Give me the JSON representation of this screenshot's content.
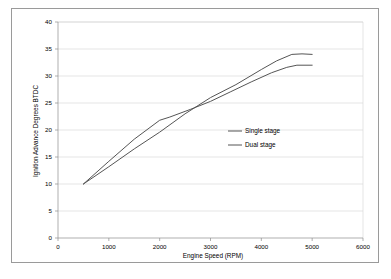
{
  "chart_data": {
    "type": "line",
    "title": "",
    "xlabel": "Engine Speed (RPM)",
    "ylabel": "Ignition Advance Degrees BTDC",
    "xlim": [
      0,
      6000
    ],
    "ylim": [
      0,
      40
    ],
    "xticks": [
      "0",
      "1000",
      "2000",
      "3000",
      "4000",
      "5000",
      "6000"
    ],
    "yticks": [
      "0",
      "5",
      "10",
      "15",
      "20",
      "25",
      "30",
      "35",
      "40"
    ],
    "grid": "horizontal",
    "legend_position": "center-right-inside",
    "series": [
      {
        "name": "Single stage",
        "color": "#555555",
        "x": [
          500,
          1000,
          1500,
          2000,
          2200,
          2600,
          3000,
          3400,
          3800,
          4200,
          4500,
          4700,
          5000
        ],
        "values": [
          10,
          14.2,
          18.3,
          21.8,
          22.4,
          23.8,
          25.3,
          27.1,
          28.9,
          30.6,
          31.6,
          32.0,
          32.0
        ]
      },
      {
        "name": "Dual stage",
        "color": "#555555",
        "x": [
          500,
          1000,
          1500,
          2000,
          2500,
          3000,
          3500,
          4000,
          4300,
          4600,
          4800,
          5000
        ],
        "values": [
          10,
          13.2,
          16.5,
          19.6,
          23.0,
          26.0,
          28.4,
          31.2,
          32.8,
          34.0,
          34.1,
          34.0
        ]
      }
    ]
  },
  "legend": {
    "entries": [
      {
        "label": "Single stage"
      },
      {
        "label": "Dual stage"
      }
    ]
  },
  "axes": {
    "x_title": "Engine Speed (RPM)",
    "y_title": "Ignition Advance Degrees BTDC"
  }
}
